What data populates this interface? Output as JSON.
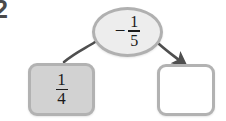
{
  "problem": {
    "number": "2"
  },
  "colors": {
    "page_background": "#ffffff",
    "node_fill": "#ededed",
    "node_border": "#b0b0b0",
    "filled_box_fill": "#d2d2d2",
    "box_border": "#b2b2b2",
    "empty_box_fill": "#ffffff",
    "arrow": "#4f4f4f",
    "text": "#1b1b1b"
  },
  "operator_node": {
    "name": "operator-ellipse",
    "sign": "−",
    "fraction": {
      "numerator": "1",
      "denominator": "5"
    },
    "full_text": "− 1/5"
  },
  "boxes": [
    {
      "name": "value-box-left",
      "state": "filled",
      "fraction": {
        "numerator": "1",
        "denominator": "4"
      },
      "full_text": "1/4"
    },
    {
      "name": "value-box-right",
      "state": "empty",
      "fraction": {
        "numerator": "",
        "denominator": ""
      },
      "full_text": ""
    }
  ],
  "arrows": [
    {
      "name": "arrow-to-left-box",
      "from": "operator-ellipse",
      "to": "value-box-left",
      "has_arrowhead": false
    },
    {
      "name": "arrow-to-right-box",
      "from": "operator-ellipse",
      "to": "value-box-right",
      "has_arrowhead": true
    }
  ]
}
